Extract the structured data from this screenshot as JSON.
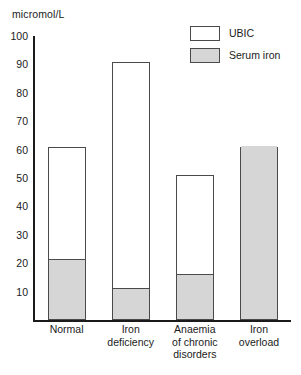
{
  "axis_title": "micromol/L",
  "legend": {
    "items": [
      {
        "label": "UBIC",
        "swatch": "white"
      },
      {
        "label": "Serum iron",
        "swatch": "gray"
      }
    ]
  },
  "colors": {
    "serum_iron_fill": "#d6d6d6",
    "ubic_fill": "#ffffff",
    "bar_border": "#4a4a4a",
    "axis": "#1a1a1a"
  },
  "chart_data": {
    "type": "bar",
    "title": "",
    "xlabel": "",
    "ylabel": "micromol/L",
    "ylim": [
      0,
      100
    ],
    "yticks": [
      10,
      20,
      30,
      40,
      50,
      60,
      70,
      80,
      90,
      100
    ],
    "ytick_labels": [
      "10",
      "20",
      "30",
      "40",
      "50",
      "60",
      "70",
      "80",
      "90",
      "100"
    ],
    "grid": false,
    "stacked": true,
    "legend_position": "top-right",
    "categories": [
      "Normal",
      "Iron\ndeficiency",
      "Anaemia\nof chronic\ndisorders",
      "Iron\noverload"
    ],
    "series": [
      {
        "name": "Serum iron",
        "values": [
          21,
          11,
          16,
          61
        ]
      },
      {
        "name": "UBIC",
        "values": [
          40,
          80,
          35,
          0
        ]
      }
    ],
    "totals": [
      61,
      91,
      51,
      61
    ]
  }
}
